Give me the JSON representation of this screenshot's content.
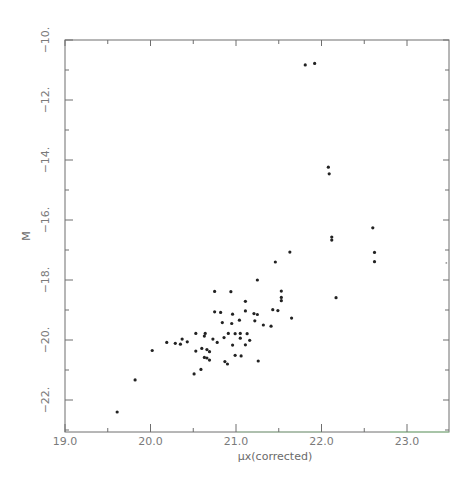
{
  "chart_data": {
    "type": "scatter",
    "title": "",
    "xlabel": "μx(corrected)",
    "ylabel": "M",
    "xlim": [
      19.0,
      23.5
    ],
    "ylim": [
      -23.0,
      -10.0
    ],
    "y_inverted": true,
    "grid": false,
    "legend": null,
    "x_ticks": [
      "19.0",
      "20.0",
      "21.0",
      "22.0",
      "23.0"
    ],
    "y_ticks": [
      "-10.",
      "-12.",
      "-14.",
      "-16.",
      "-18.",
      "-20.",
      "-22."
    ],
    "series": [
      {
        "name": "points",
        "marker": "dot",
        "color": "#222222",
        "points": [
          [
            19.61,
            -22.4
          ],
          [
            19.82,
            -21.33
          ],
          [
            20.02,
            -20.35
          ],
          [
            20.19,
            -20.08
          ],
          [
            20.29,
            -20.11
          ],
          [
            20.35,
            -20.14
          ],
          [
            20.37,
            -19.97
          ],
          [
            20.43,
            -20.06
          ],
          [
            20.53,
            -19.78
          ],
          [
            20.53,
            -20.37
          ],
          [
            20.6,
            -20.28
          ],
          [
            20.63,
            -19.87
          ],
          [
            20.64,
            -19.78
          ],
          [
            20.66,
            -20.32
          ],
          [
            20.69,
            -20.39
          ],
          [
            20.63,
            -20.58
          ],
          [
            20.66,
            -20.6
          ],
          [
            20.69,
            -20.67
          ],
          [
            20.59,
            -20.98
          ],
          [
            20.51,
            -21.13
          ],
          [
            20.73,
            -19.97
          ],
          [
            20.75,
            -18.38
          ],
          [
            20.75,
            -19.06
          ],
          [
            20.82,
            -19.08
          ],
          [
            20.78,
            -20.08
          ],
          [
            20.84,
            -19.42
          ],
          [
            20.86,
            -19.92
          ],
          [
            20.87,
            -20.72
          ],
          [
            20.9,
            -20.8
          ],
          [
            20.91,
            -19.78
          ],
          [
            20.94,
            -18.39
          ],
          [
            20.95,
            -19.45
          ],
          [
            20.96,
            -20.17
          ],
          [
            20.96,
            -19.14
          ],
          [
            20.99,
            -19.79
          ],
          [
            20.99,
            -20.51
          ],
          [
            21.04,
            -19.34
          ],
          [
            21.05,
            -19.94
          ],
          [
            21.05,
            -19.78
          ],
          [
            21.06,
            -20.53
          ],
          [
            21.11,
            -18.71
          ],
          [
            21.11,
            -19.03
          ],
          [
            21.11,
            -20.16
          ],
          [
            21.13,
            -19.79
          ],
          [
            21.16,
            -20.01
          ],
          [
            21.21,
            -19.12
          ],
          [
            21.22,
            -19.36
          ],
          [
            21.25,
            -19.15
          ],
          [
            21.25,
            -18.0
          ],
          [
            21.26,
            -20.7
          ],
          [
            21.32,
            -19.5
          ],
          [
            21.41,
            -19.54
          ],
          [
            21.43,
            -18.99
          ],
          [
            21.46,
            -17.4
          ],
          [
            21.49,
            -19.02
          ],
          [
            21.53,
            -18.37
          ],
          [
            21.53,
            -18.58
          ],
          [
            21.53,
            -18.69
          ],
          [
            21.63,
            -17.07
          ],
          [
            21.65,
            -19.27
          ],
          [
            21.81,
            -10.83
          ],
          [
            21.92,
            -10.78
          ],
          [
            22.08,
            -14.24
          ],
          [
            22.09,
            -14.46
          ],
          [
            22.12,
            -16.57
          ],
          [
            22.12,
            -16.67
          ],
          [
            22.17,
            -18.59
          ],
          [
            22.6,
            -16.26
          ],
          [
            22.62,
            -17.08
          ],
          [
            22.62,
            -17.39
          ],
          [
            23.46,
            -17.43
          ]
        ]
      }
    ]
  },
  "axes": {
    "x_title": "μx(corrected)",
    "y_title": "M",
    "x_tick_labels": [
      "19.0",
      "20.0",
      "21.0",
      "22.0",
      "23.0"
    ],
    "y_tick_labels": [
      "-10.",
      "-12.",
      "-14.",
      "-16.",
      "-18.",
      "-20.",
      "-22."
    ]
  },
  "colors": {
    "axis": "#6e6e6e",
    "point": "#222222",
    "label": "#7a7a7a"
  }
}
